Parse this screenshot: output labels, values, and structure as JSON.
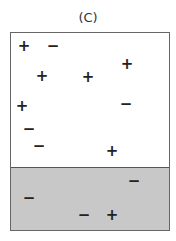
{
  "title": "(C)",
  "colors": {
    "shaded_region": "#c8c8c8",
    "border": "#666666"
  },
  "charges": [
    {
      "sign": "+",
      "x": 24,
      "y": 46,
      "region": "upper"
    },
    {
      "sign": "−",
      "x": 53,
      "y": 46,
      "region": "upper"
    },
    {
      "sign": "+",
      "x": 127,
      "y": 64,
      "region": "upper"
    },
    {
      "sign": "+",
      "x": 42,
      "y": 76,
      "region": "upper"
    },
    {
      "sign": "+",
      "x": 88,
      "y": 77,
      "region": "upper"
    },
    {
      "sign": "+",
      "x": 22,
      "y": 106,
      "region": "upper"
    },
    {
      "sign": "−",
      "x": 126,
      "y": 104,
      "region": "upper"
    },
    {
      "sign": "−",
      "x": 29,
      "y": 129,
      "region": "upper"
    },
    {
      "sign": "−",
      "x": 39,
      "y": 146,
      "region": "upper"
    },
    {
      "sign": "+",
      "x": 112,
      "y": 151,
      "region": "upper"
    },
    {
      "sign": "−",
      "x": 134,
      "y": 181,
      "region": "shaded"
    },
    {
      "sign": "−",
      "x": 29,
      "y": 198,
      "region": "shaded"
    },
    {
      "sign": "−",
      "x": 84,
      "y": 215,
      "region": "shaded"
    },
    {
      "sign": "+",
      "x": 112,
      "y": 215,
      "region": "shaded"
    }
  ]
}
